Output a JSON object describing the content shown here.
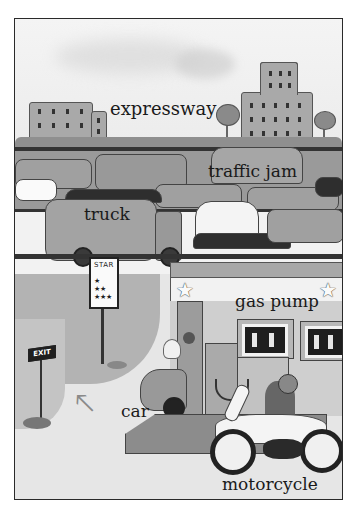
{
  "scene": {
    "title": "Traffic and gas station vocabulary illustration",
    "colors": {
      "frame_border": "#2a2a2a",
      "label_text": "#1a1a1a",
      "background": "#f2f2f2"
    }
  },
  "labels": {
    "expressway": "expressway",
    "traffic_jam": "traffic jam",
    "truck": "truck",
    "gas_pump": "gas pump",
    "car": "car",
    "motorcycle": "motorcycle"
  },
  "signs": {
    "star_sign": "STAR",
    "exit_sign": "EXIT"
  },
  "icons": {
    "star": "★",
    "arrow": "🡔"
  }
}
